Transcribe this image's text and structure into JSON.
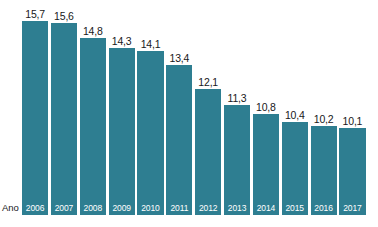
{
  "chart_data": {
    "type": "bar",
    "title": "",
    "xlabel": "Ano",
    "ylabel": "",
    "categories": [
      "2006",
      "2007",
      "2008",
      "2009",
      "2010",
      "2011",
      "2012",
      "2013",
      "2014",
      "2015",
      "2016",
      "2017"
    ],
    "values": [
      15.7,
      15.6,
      14.8,
      14.3,
      14.1,
      13.4,
      12.1,
      11.3,
      10.8,
      10.4,
      10.2,
      10.1
    ],
    "value_labels": [
      "15,7",
      "15,6",
      "14,8",
      "14,3",
      "14,1",
      "13,4",
      "12,1",
      "11,3",
      "10,8",
      "10,4",
      "10,2",
      "10,1"
    ],
    "decimal_separator": ",",
    "ylim": [
      5.5,
      16.6
    ],
    "grid": false,
    "legend": null,
    "bar_color": "#2e7e91",
    "value_label_color": "#18181a",
    "category_label_color": "#ffffff",
    "background_color": "#ffffff",
    "axis_label_color": "#18181a"
  }
}
